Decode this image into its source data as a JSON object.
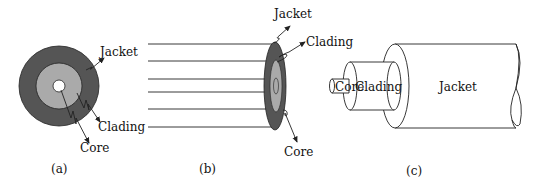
{
  "figure": {
    "panels": [
      {
        "id": "a",
        "caption": "(a)",
        "labels": {
          "jacket": "Jacket",
          "cladding": "Clading",
          "core": "Core"
        }
      },
      {
        "id": "b",
        "caption": "(b)",
        "labels": {
          "jacket": "Jacket",
          "cladding": "Clading",
          "core": "Core"
        }
      },
      {
        "id": "c",
        "caption": "(c)",
        "labels": {
          "core": "Core",
          "cladding": "Clading",
          "jacket": "Jacket"
        }
      }
    ],
    "colors": {
      "jacket": "#555555",
      "cladding": "#aaaaaa",
      "core": "#ffffff",
      "stroke": "#222222"
    }
  }
}
